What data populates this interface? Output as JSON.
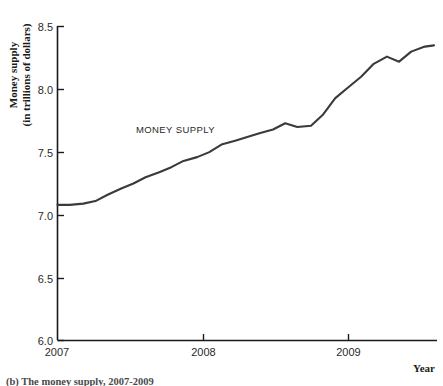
{
  "figure": {
    "caption": "(b) The money supply, 2007-2009",
    "background_color": "#ffffff",
    "line_color": "#3a3a3a",
    "axis_color": "#1a1a1a"
  },
  "chart_data": {
    "type": "line",
    "title": "",
    "subtitle": "",
    "xlabel": "Year",
    "ylabel": "Money supply\n(in trillions of dollars)",
    "ylabel_line1": "Money supply",
    "ylabel_line2": "(in trillions of dollars)",
    "series_annotation": "MONEY SUPPLY",
    "grid": false,
    "legend": "none",
    "xlim": [
      2007.0,
      2009.5
    ],
    "ylim": [
      6.0,
      8.5
    ],
    "xticks": [
      2007,
      2008,
      2009
    ],
    "xtick_labels": [
      "2007",
      "2008",
      "2009"
    ],
    "yticks": [
      6.0,
      6.5,
      7.0,
      7.5,
      8.0,
      8.5
    ],
    "ytick_labels": [
      "6.0",
      "6.5",
      "7.0",
      "7.5",
      "8.0",
      "8.5"
    ],
    "series": [
      {
        "name": "MONEY SUPPLY",
        "x": [
          2007.0,
          2007.08,
          2007.17,
          2007.25,
          2007.33,
          2007.42,
          2007.5,
          2007.58,
          2007.67,
          2007.75,
          2007.83,
          2007.92,
          2008.0,
          2008.08,
          2008.17,
          2008.25,
          2008.33,
          2008.42,
          2008.5,
          2008.58,
          2008.67,
          2008.75,
          2008.83,
          2008.92,
          2009.0,
          2009.08,
          2009.17,
          2009.25,
          2009.33,
          2009.42,
          2009.48
        ],
        "values": [
          7.08,
          7.08,
          7.09,
          7.11,
          7.16,
          7.21,
          7.25,
          7.3,
          7.34,
          7.38,
          7.43,
          7.46,
          7.5,
          7.56,
          7.59,
          7.62,
          7.65,
          7.68,
          7.73,
          7.7,
          7.71,
          7.8,
          7.93,
          8.02,
          8.1,
          8.2,
          8.26,
          8.22,
          8.3,
          8.34,
          8.35
        ]
      }
    ]
  }
}
